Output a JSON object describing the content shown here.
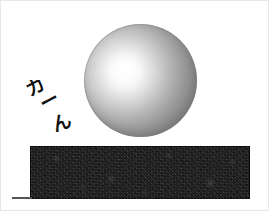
{
  "scene": {
    "title": "Sphere resting on a dark block",
    "background_color": "#ffffff",
    "width": 269,
    "height": 211
  },
  "sound_effect": {
    "text": "カーん",
    "romaji": "kaan",
    "meaning": "metallic clang sound effect",
    "characters": [
      {
        "glyph": "カ",
        "x": 8,
        "y": 17,
        "rotate": -28,
        "size": 19
      },
      {
        "glyph": "ー",
        "x": 22,
        "y": 31,
        "rotate": -28,
        "size": 19
      },
      {
        "glyph": "ん",
        "x": 33,
        "y": 52,
        "rotate": -20,
        "size": 19
      }
    ],
    "color": "#111111"
  },
  "sphere": {
    "label": "glossy sphere",
    "left": 84,
    "top": 24,
    "diameter": 113,
    "highlight_x_pct": 36,
    "highlight_y_pct": 42,
    "highlight_color": "#ffffff",
    "mid_color": "#c6c6c6",
    "edge_color": "#8f8f8f"
  },
  "block": {
    "label": "dark textured block",
    "left": 30,
    "top": 146,
    "width": 220,
    "height": 53,
    "fill_color": "#1a1a1a",
    "texture": "mottled-grain"
  },
  "ground_line": {
    "label": "ground line",
    "left": 12,
    "top": 197,
    "width": 20,
    "color": "#555555"
  }
}
